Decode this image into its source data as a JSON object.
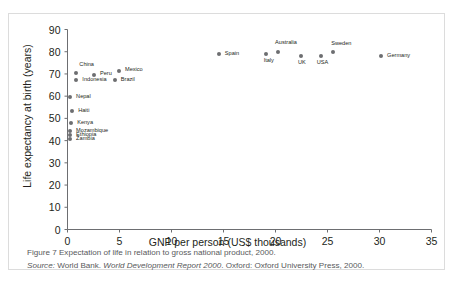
{
  "figure": {
    "caption_figure_number": "Figure 7",
    "caption_text": "Expectation of life in relation to gross national product, 2000.",
    "source_label": "Source:",
    "source_publisher": "World Bank.",
    "source_title": "World Development Report 2000",
    "source_imprint": ". Oxford: Oxford University Press, 2000."
  },
  "colors": {
    "marker": "#6d6e71",
    "axis": "#6d6e71",
    "text": "#231f20",
    "caption": "#58595b",
    "border": "#dcdcdc"
  },
  "chart_data": {
    "type": "scatter",
    "title": "",
    "xlabel": "GNP per person (US$ thousands)",
    "ylabel": "Life expectancy at birth (years)",
    "xlim": [
      0,
      35
    ],
    "ylim": [
      0,
      90
    ],
    "xticks": [
      0,
      5,
      10,
      15,
      20,
      25,
      30,
      35
    ],
    "yticks": [
      0,
      10,
      20,
      30,
      40,
      50,
      60,
      70,
      80,
      90
    ],
    "grid": false,
    "legend": "none",
    "points": [
      {
        "label": "China",
        "x": 0.9,
        "y": 70.2,
        "lx": 3,
        "ly": -11,
        "anchor": "left"
      },
      {
        "label": "Indonesia",
        "x": 0.9,
        "y": 67.0,
        "lx": 6,
        "ly": -3,
        "anchor": "left"
      },
      {
        "label": "Peru",
        "x": 2.6,
        "y": 69.3,
        "lx": 6,
        "ly": -4,
        "anchor": "left"
      },
      {
        "label": "Mexico",
        "x": 5.0,
        "y": 71.0,
        "lx": 6,
        "ly": -4,
        "anchor": "left"
      },
      {
        "label": "Brazil",
        "x": 4.6,
        "y": 67.2,
        "lx": 6,
        "ly": -3,
        "anchor": "left"
      },
      {
        "label": "Nepal",
        "x": 0.3,
        "y": 59.2,
        "lx": 6,
        "ly": -3,
        "anchor": "left"
      },
      {
        "label": "Haiti",
        "x": 0.5,
        "y": 53.0,
        "lx": 6,
        "ly": -3,
        "anchor": "left"
      },
      {
        "label": "Kenya",
        "x": 0.4,
        "y": 47.8,
        "lx": 6,
        "ly": -3,
        "anchor": "left"
      },
      {
        "label": "Mozambique",
        "x": 0.3,
        "y": 44.0,
        "lx": 6,
        "ly": -3,
        "anchor": "left"
      },
      {
        "label": "Ethiopia",
        "x": 0.3,
        "y": 42.2,
        "lx": 6,
        "ly": -3,
        "anchor": "left"
      },
      {
        "label": "Zambia",
        "x": 0.3,
        "y": 40.4,
        "lx": 6,
        "ly": -3,
        "anchor": "left"
      },
      {
        "label": "Spain",
        "x": 14.6,
        "y": 78.6,
        "lx": 6,
        "ly": -3,
        "anchor": "left"
      },
      {
        "label": "Italy",
        "x": 19.1,
        "y": 78.6,
        "lx": -2,
        "ly": 4,
        "anchor": "left"
      },
      {
        "label": "Australia",
        "x": 20.3,
        "y": 79.6,
        "lx": -3,
        "ly": -12,
        "anchor": "left"
      },
      {
        "label": "UK",
        "x": 22.5,
        "y": 78.0,
        "lx": -3,
        "ly": 4,
        "anchor": "left"
      },
      {
        "label": "USA",
        "x": 24.4,
        "y": 78.0,
        "lx": -4,
        "ly": 4,
        "anchor": "left"
      },
      {
        "label": "Sweden",
        "x": 25.6,
        "y": 79.8,
        "lx": -2,
        "ly": -11,
        "anchor": "left"
      },
      {
        "label": "Germany",
        "x": 30.2,
        "y": 78.0,
        "lx": 6,
        "ly": -3,
        "anchor": "left"
      }
    ]
  }
}
